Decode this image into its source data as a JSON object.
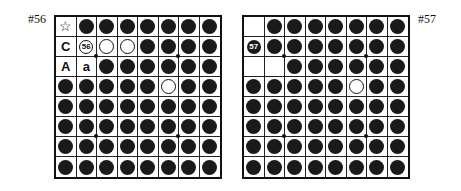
{
  "figure": {
    "boards": [
      {
        "label": "#56",
        "rows": [
          [
            "star",
            "B",
            "B",
            "B",
            "B",
            "B",
            "B",
            "B"
          ],
          [
            "C",
            "n:56:W",
            "W",
            "W",
            "B",
            "B",
            "B",
            "B"
          ],
          [
            "A",
            "a",
            "B",
            "B",
            "B",
            "B",
            "B",
            "B"
          ],
          [
            "B",
            "B",
            "B",
            "B",
            "B",
            "W",
            "B",
            "B"
          ],
          [
            "B",
            "B",
            "B",
            "B",
            "B",
            "B",
            "B",
            "B"
          ],
          [
            "B",
            "B",
            "B",
            "B",
            "B",
            "B",
            "B",
            "B"
          ],
          [
            "B",
            "B",
            "B",
            "B",
            "B",
            "B",
            "B",
            "B"
          ],
          [
            "B",
            "B",
            "B",
            "B",
            "B",
            "B",
            "B",
            "B"
          ]
        ]
      },
      {
        "label": "#57",
        "rows": [
          [
            "",
            "B",
            "B",
            "B",
            "B",
            "B",
            "B",
            "B"
          ],
          [
            "n:57:B",
            "B",
            "B",
            "B",
            "B",
            "B",
            "B",
            "B"
          ],
          [
            "",
            "",
            "B",
            "B",
            "B",
            "B",
            "B",
            "B"
          ],
          [
            "B",
            "B",
            "B",
            "B",
            "B",
            "W",
            "B",
            "B"
          ],
          [
            "B",
            "B",
            "B",
            "B",
            "B",
            "B",
            "B",
            "B"
          ],
          [
            "B",
            "B",
            "B",
            "B",
            "B",
            "B",
            "B",
            "B"
          ],
          [
            "B",
            "B",
            "B",
            "B",
            "B",
            "B",
            "B",
            "B"
          ],
          [
            "B",
            "B",
            "B",
            "B",
            "B",
            "B",
            "B",
            "B"
          ]
        ]
      }
    ],
    "legend": {
      "B": "black disc",
      "W": "white disc",
      "star": "star marker",
      "n": "numbered move disc"
    },
    "colors": {
      "black": "#1a1a1a",
      "white": "#ffffff",
      "grid": "#222222"
    }
  }
}
